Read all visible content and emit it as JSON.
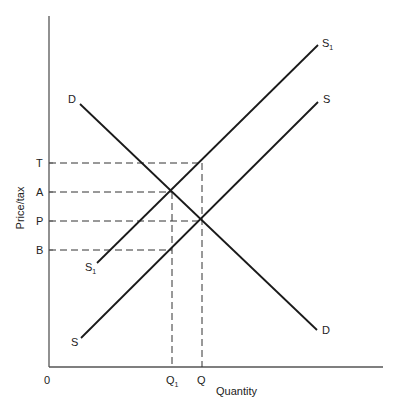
{
  "diagram": {
    "y_axis_label": "Price/tax",
    "x_axis_label": "Quantity",
    "origin_label": "0",
    "price_levels": [
      {
        "label": "T",
        "y": 163
      },
      {
        "label": "A",
        "y": 192
      },
      {
        "label": "P",
        "y": 221
      },
      {
        "label": "B",
        "y": 250
      }
    ],
    "quantity_levels": [
      {
        "label": "Q",
        "sub": "1",
        "x": 172
      },
      {
        "label": "Q",
        "sub": "",
        "x": 202
      }
    ],
    "curves": [
      {
        "name": "demand",
        "start_label": "D",
        "end_label": "D"
      },
      {
        "name": "supply-after-tax",
        "label": "S",
        "sub": "1"
      },
      {
        "name": "supply",
        "label": "S"
      }
    ],
    "colors": {
      "line": "#1a1a1a",
      "axis": "#555555",
      "dash": "#333333"
    }
  }
}
